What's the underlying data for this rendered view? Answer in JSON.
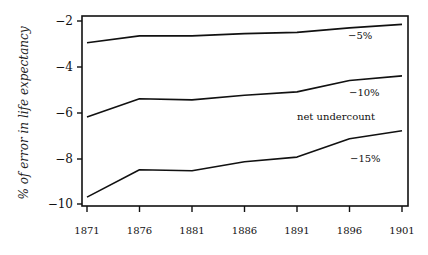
{
  "chart_data": {
    "type": "line",
    "title": "",
    "xlabel": "",
    "ylabel": "% of error in life expectancy",
    "x": [
      1871,
      1876,
      1881,
      1886,
      1891,
      1896,
      1901
    ],
    "xticks": [
      "1871",
      "1876",
      "1881",
      "1886",
      "1891",
      "1896",
      "1901"
    ],
    "yticks": [
      "-2",
      "-4",
      "-6",
      "-8",
      "-10"
    ],
    "ylim": [
      -10,
      -2
    ],
    "xlim": [
      1871,
      1901
    ],
    "grid": false,
    "legend": "inline labels at right",
    "series": [
      {
        "name": "-5%",
        "values": [
          -2.95,
          -2.65,
          -2.65,
          -2.55,
          -2.5,
          -2.3,
          -2.15
        ]
      },
      {
        "name": "-10%",
        "values": [
          -6.2,
          -5.4,
          -5.45,
          -5.25,
          -5.1,
          -4.6,
          -4.4
        ]
      },
      {
        "name": "-15%",
        "values": [
          -9.7,
          -8.5,
          -8.55,
          -8.15,
          -7.95,
          -7.15,
          -6.8
        ]
      }
    ],
    "annotations": [
      "net undercount"
    ]
  },
  "labels": {
    "ylabel": "% of error in life expectancy",
    "annotation": "net undercount",
    "series_5": "−5%",
    "series_10": "−10%",
    "series_15": "−15%",
    "ytick_0": "−2",
    "ytick_1": "−4",
    "ytick_2": "−6",
    "ytick_3": "−8",
    "ytick_4": "−10",
    "xtick_0": "1871",
    "xtick_1": "1876",
    "xtick_2": "1881",
    "xtick_3": "1886",
    "xtick_4": "1891",
    "xtick_5": "1896",
    "xtick_6": "1901"
  }
}
